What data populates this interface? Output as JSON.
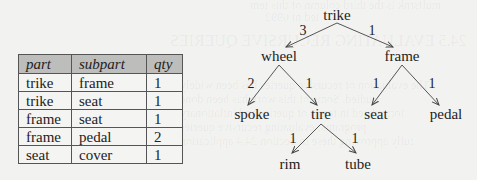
{
  "table": {
    "headers": [
      "part",
      "subpart",
      "qty"
    ],
    "rows": [
      [
        "trike",
        "frame",
        "1"
      ],
      [
        "trike",
        "seat",
        "1"
      ],
      [
        "frame",
        "seat",
        "1"
      ],
      [
        "frame",
        "pedal",
        "2"
      ],
      [
        "seat",
        "cover",
        "1"
      ]
    ]
  },
  "tree": {
    "nodes": {
      "trike": "trike",
      "wheel": "wheel",
      "frame": "frame",
      "spoke": "spoke",
      "tire": "tire",
      "seat": "seat",
      "pedal": "pedal",
      "rim": "rim",
      "tube": "tube"
    },
    "edges": {
      "trike_wheel": "3",
      "trike_frame": "1",
      "wheel_spoke": "2",
      "wheel_tire": "1",
      "frame_seat": "1",
      "frame_pedal": "1",
      "tire_rim": "1",
      "tire_tube": "1"
    }
  }
}
